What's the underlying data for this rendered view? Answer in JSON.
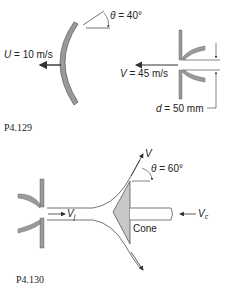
{
  "figures": [
    {
      "id": "P4.129",
      "caption": "P4.129",
      "labels": {
        "theta_sym": "θ",
        "theta_val": " = 40°",
        "u_sym": "U",
        "u_val": " = 10 m/s",
        "v_sym": "V",
        "v_val": " = 45 m/s",
        "d_sym": "d",
        "d_val": " = 50 mm"
      }
    },
    {
      "id": "P4.130",
      "caption": "P4.130",
      "labels": {
        "v_sym": "V",
        "theta_sym": "θ",
        "theta_val": " = 60°",
        "vj_sym": "V",
        "vj_sub": "j",
        "vc_sym": "V",
        "vc_sub": "c",
        "cone": "Cone"
      }
    }
  ],
  "colors": {
    "vane_fill": "#9a9a9a",
    "cone_fill": "#c8c8c8",
    "line": "#333333"
  }
}
